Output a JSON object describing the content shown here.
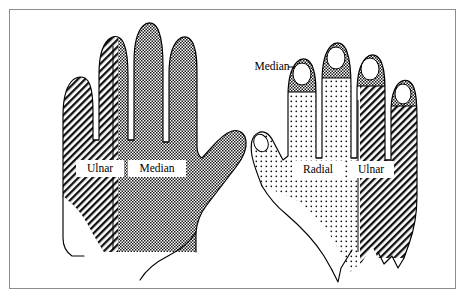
{
  "figure": {
    "frame": {
      "border_color": "#8d8d8d",
      "background": "#ffffff"
    },
    "views": [
      {
        "name": "left-hand-palmar",
        "description": "Palmar (volar) surface of the hand",
        "regions": [
          {
            "nerve": "Ulnar",
            "pattern": "diagonal-hatch",
            "area": "ulnar border, little finger and ulnar half of ring finger"
          },
          {
            "nerve": "Median",
            "pattern": "dense-dot",
            "area": "thenar palm, thumb, index, middle and radial half of ring finger"
          }
        ]
      },
      {
        "name": "right-hand-dorsal",
        "description": "Dorsal surface of the hand",
        "regions": [
          {
            "nerve": "Radial",
            "pattern": "sparse-dot",
            "area": "dorsum of thumb, index, middle and radial half of ring finger"
          },
          {
            "nerve": "Ulnar",
            "pattern": "diagonal-hatch",
            "area": "ulnar dorsum, little finger and ulnar half of ring finger"
          },
          {
            "nerve": "Median",
            "pattern": "dense-dot",
            "area": "dorsal fingertips of thumb, index, middle and ring fingers"
          }
        ]
      }
    ],
    "labels": [
      {
        "id": "left-ulnar",
        "text": "Ulnar",
        "x": 100,
        "y": 169,
        "boxed": true,
        "leader": false
      },
      {
        "id": "left-median",
        "text": "Median",
        "x": 157,
        "y": 169,
        "boxed": true,
        "leader": false
      },
      {
        "id": "right-median",
        "text": "Median",
        "x": 272,
        "y": 67,
        "boxed": false,
        "leader": true
      },
      {
        "id": "right-radial",
        "text": "Radial",
        "x": 318,
        "y": 170,
        "boxed": true,
        "leader": false
      },
      {
        "id": "right-ulnar",
        "text": "Ulnar",
        "x": 371,
        "y": 170,
        "boxed": true,
        "leader": false
      }
    ],
    "colors": {
      "ink": "#000000",
      "paper": "#ffffff",
      "frame": "#8d8d8d"
    }
  }
}
